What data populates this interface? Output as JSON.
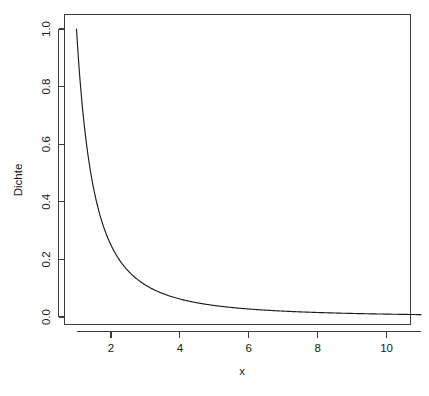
{
  "figure": {
    "background_color": "#ffffff",
    "foreground_color": "#1a1a1a",
    "line_color": "#1c1c1c",
    "axis_color": "#3c3c3c",
    "title": "",
    "width": 429,
    "height": 396
  },
  "chart_data": {
    "type": "line",
    "title": "",
    "subtitle": "",
    "xlabel": "x",
    "ylabel": "Dichte",
    "xlim": [
      1,
      11
    ],
    "ylim": [
      0.0,
      1.04
    ],
    "grid": false,
    "legend": null,
    "annotations": [],
    "xticks": [
      2,
      4,
      6,
      8,
      10
    ],
    "xtick_labels": [
      "2",
      "4",
      "6",
      "8",
      "10"
    ],
    "yticks": [
      0.0,
      0.2,
      0.4,
      0.6,
      0.8,
      1.0
    ],
    "ytick_labels": [
      "0.0",
      "0.2",
      "0.4",
      "0.6",
      "0.8",
      "1.0"
    ],
    "series": [
      {
        "name": "Dichte",
        "formula": "1/x^2",
        "x": [
          1.0,
          1.1,
          1.2,
          1.3,
          1.4,
          1.5,
          1.6,
          1.7,
          1.8,
          1.9,
          2.0,
          2.2,
          2.4,
          2.6,
          2.8,
          3.0,
          3.2,
          3.4,
          3.6,
          3.8,
          4.0,
          4.4,
          4.8,
          5.2,
          5.6,
          6.0,
          6.5,
          7.0,
          7.5,
          8.0,
          8.5,
          9.0,
          9.5,
          10.0,
          10.5,
          11.0
        ],
        "y": [
          1.0,
          0.8264,
          0.6944,
          0.5917,
          0.5102,
          0.4444,
          0.3906,
          0.346,
          0.3086,
          0.277,
          0.25,
          0.2066,
          0.1736,
          0.1479,
          0.1276,
          0.1111,
          0.0977,
          0.0865,
          0.0772,
          0.0693,
          0.0625,
          0.0517,
          0.0434,
          0.037,
          0.0319,
          0.0278,
          0.0237,
          0.0204,
          0.0178,
          0.0156,
          0.0138,
          0.0123,
          0.0111,
          0.01,
          0.0091,
          0.0083
        ]
      }
    ]
  }
}
